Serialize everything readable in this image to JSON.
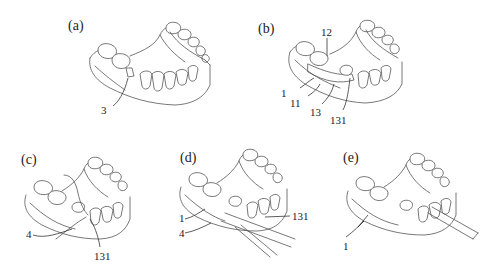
{
  "figure": {
    "panels": [
      {
        "id": "a",
        "label": "(a)",
        "refs": [
          "3"
        ]
      },
      {
        "id": "b",
        "label": "(b)",
        "refs": [
          "12",
          "1",
          "11",
          "13",
          "131"
        ]
      },
      {
        "id": "c",
        "label": "(c)",
        "refs": [
          "4",
          "131"
        ]
      },
      {
        "id": "d",
        "label": "(d)",
        "refs": [
          "1",
          "4",
          "131"
        ]
      },
      {
        "id": "e",
        "label": "(e)",
        "refs": [
          "1"
        ]
      }
    ],
    "line_color": "#555555",
    "background": "#ffffff"
  }
}
